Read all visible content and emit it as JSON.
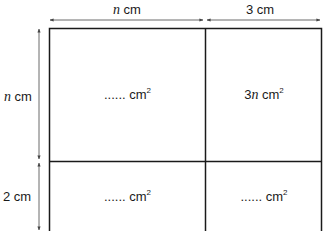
{
  "diagram": {
    "top_dimensions": [
      {
        "var": "n",
        "text": " cm"
      },
      {
        "var": "",
        "text": "3 cm"
      }
    ],
    "left_dimensions": [
      {
        "var": "n",
        "text": " cm"
      },
      {
        "var": "",
        "text": "2 cm"
      }
    ],
    "cells": [
      {
        "prefix": "......",
        "var": "",
        "unit": " cm",
        "exp": "2"
      },
      {
        "prefix": "3",
        "var": "n",
        "unit": " cm",
        "exp": "2"
      },
      {
        "prefix": "......",
        "var": "",
        "unit": " cm",
        "exp": "2"
      },
      {
        "prefix": "......",
        "var": "",
        "unit": " cm",
        "exp": "2"
      }
    ],
    "colors": {
      "line": "#1a1a1a",
      "arrow": "#444444"
    }
  }
}
